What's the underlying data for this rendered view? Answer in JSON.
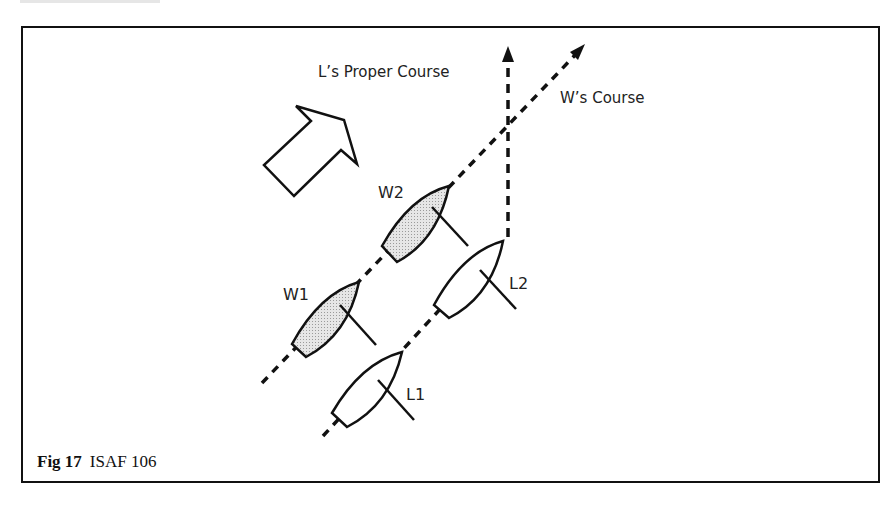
{
  "figure": {
    "caption_bold": "Fig 17",
    "caption_text": "ISAF 106"
  },
  "labels": {
    "l_proper_course": "L’s Proper Course",
    "w_course": "W’s Course",
    "w1": "W1",
    "w2": "W2",
    "l1": "L1",
    "l2": "L2"
  },
  "colors": {
    "line": "#111111",
    "windward_boat_fill": "#d4d4d4",
    "leeward_boat_fill": "#ffffff"
  }
}
